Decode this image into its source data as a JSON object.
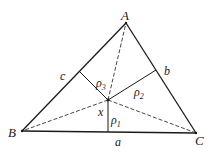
{
  "diagram": {
    "type": "triangle-with-interior-point-perpendiculars",
    "vertices": {
      "A": {
        "label": "A",
        "x": 126,
        "y": 23
      },
      "B": {
        "label": "B",
        "x": 22,
        "y": 131
      },
      "C": {
        "label": "C",
        "x": 196,
        "y": 133
      }
    },
    "interior_point": {
      "label": "x",
      "x": 108,
      "y": 100
    },
    "sides": {
      "a": {
        "label": "a"
      },
      "b": {
        "label": "b"
      },
      "c": {
        "label": "c"
      }
    },
    "perpendiculars": {
      "rho1": {
        "label": "ρ",
        "sub": "1"
      },
      "rho2": {
        "label": "ρ",
        "sub": "2"
      },
      "rho3": {
        "label": "ρ",
        "sub": "3"
      }
    },
    "colors": {
      "stroke": "#1a1a1a",
      "dashed": "#333333"
    }
  }
}
